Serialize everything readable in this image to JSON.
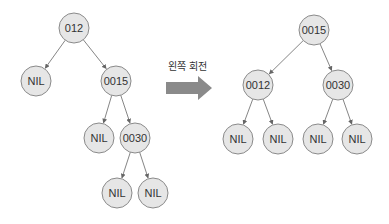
{
  "rotation_label": "왼쪽 회전",
  "arrow_color": "#8a8a8a",
  "before_tree": {
    "nodes": [
      {
        "id": "b0",
        "label": "012",
        "x": 74,
        "y": 28
      },
      {
        "id": "b1",
        "label": "NIL",
        "x": 36,
        "y": 81
      },
      {
        "id": "b2",
        "label": "0015",
        "x": 116,
        "y": 81
      },
      {
        "id": "b3",
        "label": "NIL",
        "x": 99,
        "y": 138
      },
      {
        "id": "b4",
        "label": "0030",
        "x": 135,
        "y": 138
      },
      {
        "id": "b5",
        "label": "NIL",
        "x": 117,
        "y": 193
      },
      {
        "id": "b6",
        "label": "NIL",
        "x": 153,
        "y": 193
      }
    ],
    "edges": [
      [
        "b0",
        "b1"
      ],
      [
        "b0",
        "b2"
      ],
      [
        "b2",
        "b3"
      ],
      [
        "b2",
        "b4"
      ],
      [
        "b4",
        "b5"
      ],
      [
        "b4",
        "b6"
      ]
    ]
  },
  "after_tree": {
    "nodes": [
      {
        "id": "a0",
        "label": "0015",
        "x": 314,
        "y": 30
      },
      {
        "id": "a1",
        "label": "0012",
        "x": 258,
        "y": 85
      },
      {
        "id": "a2",
        "label": "0030",
        "x": 338,
        "y": 85
      },
      {
        "id": "a3",
        "label": "NIL",
        "x": 238,
        "y": 139
      },
      {
        "id": "a4",
        "label": "NIL",
        "x": 278,
        "y": 139
      },
      {
        "id": "a5",
        "label": "NIL",
        "x": 318,
        "y": 139
      },
      {
        "id": "a6",
        "label": "NIL",
        "x": 357,
        "y": 139
      }
    ],
    "edges": [
      [
        "a0",
        "a1"
      ],
      [
        "a0",
        "a2"
      ],
      [
        "a1",
        "a3"
      ],
      [
        "a1",
        "a4"
      ],
      [
        "a2",
        "a5"
      ],
      [
        "a2",
        "a6"
      ]
    ]
  }
}
